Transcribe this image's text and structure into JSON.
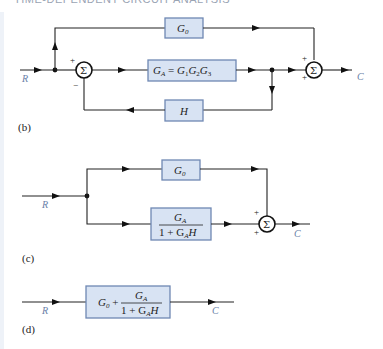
{
  "header": {
    "title": "TIME-DEPENDENT CIRCUIT ANALYSIS"
  },
  "colors": {
    "block_fill": "#d8e3f3",
    "block_stroke": "#6f88b3",
    "signal_label": "#6a7fa8",
    "wire": "#222222"
  },
  "diagram_b": {
    "label": "(b)",
    "input": "R",
    "output": "C",
    "blocks": {
      "g0": {
        "base": "G",
        "sub": "0"
      },
      "ga": {
        "text": "G",
        "sub": "A",
        "eq": " = ",
        "rhs": [
          "G",
          "1",
          "G",
          "2",
          "G",
          "3"
        ]
      },
      "h": {
        "text": "H"
      }
    },
    "sum1": {
      "symbol": "Σ",
      "signs": [
        "+",
        "−"
      ]
    },
    "sum2": {
      "symbol": "Σ",
      "signs": [
        "+",
        "+"
      ]
    }
  },
  "diagram_c": {
    "label": "(c)",
    "input": "R",
    "output": "C",
    "blocks": {
      "g0": {
        "base": "G",
        "sub": "0"
      },
      "closed_loop": {
        "num_base": "G",
        "num_sub": "A",
        "den_prefix": "1 + G",
        "den_sub": "A",
        "den_suffix": "H"
      }
    },
    "sum": {
      "symbol": "Σ",
      "signs": [
        "+",
        "+"
      ]
    }
  },
  "diagram_d": {
    "label": "(d)",
    "input": "R",
    "output": "C",
    "block": {
      "prefix_base": "G",
      "prefix_sub": "0",
      "plus": " + ",
      "num_base": "G",
      "num_sub": "A",
      "den_prefix": "1 + G",
      "den_sub": "A",
      "den_suffix": "H"
    }
  }
}
